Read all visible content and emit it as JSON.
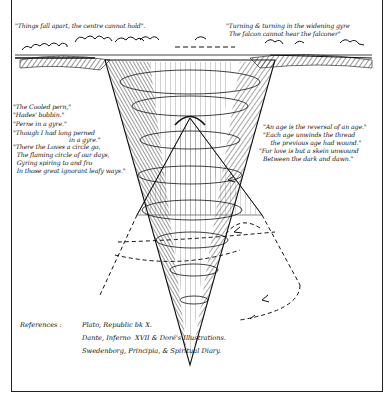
{
  "diagram": {
    "quotes": {
      "top_left": "\"Things fall apart, the centre cannot hold\".",
      "top_right_line1": "\"Turning & turning in the widening gyre",
      "top_right_line2": "The falcon cannot hear the falconer\"",
      "left_block": [
        "\"The Cooled pern,\"",
        "\"Hades' bobbin.\"",
        "\"Perne in a gyre.\"",
        "\"Though I had long perned",
        "                              in a gyre.\"",
        "\"There the Loves a circle go,",
        "  The flaming circle of our days,",
        "  Gyring spiring to and fro",
        "  In those great ignorant leafy ways.\""
      ],
      "right_block": [
        "\"An age is the reversal of an age.\"",
        "\"Each age unwinds the thread",
        "    the previous age had wound.\"",
        "\"For love is but a skein unwound",
        "Between the dark and dawn.\""
      ]
    },
    "references": {
      "label": "References :",
      "lines": [
        "Plato, Republic bk X.",
        "Dante, Inferno  XVII & Doré's Illustrations.",
        "Swedenborg, Principia, & Spiritual Diary."
      ]
    },
    "colors": {
      "ink": "#111111",
      "paper": "#ffffff"
    }
  }
}
